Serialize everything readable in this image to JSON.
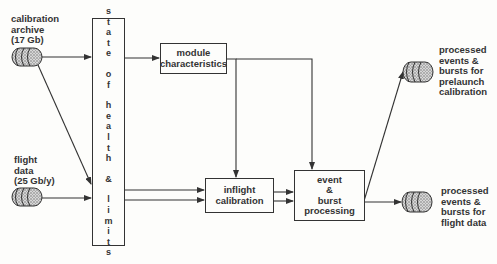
{
  "inputs": [
    {
      "label_lines": [
        "calibration",
        "archive",
        "(17 Gb)"
      ]
    },
    {
      "label_lines": [
        "flight",
        "data",
        "(25 Gb/y)"
      ]
    }
  ],
  "state_of_health": {
    "words": [
      "state",
      "of",
      "health",
      "&",
      "limits"
    ]
  },
  "module_characteristics": {
    "lines": [
      "module",
      "characteristics"
    ]
  },
  "inflight_calibration": {
    "lines": [
      "inflight",
      "calibration"
    ]
  },
  "event_burst": {
    "lines": [
      "event",
      "&",
      "burst",
      "processing"
    ]
  },
  "outputs": [
    {
      "label_lines": [
        "processed",
        "events &",
        "bursts for",
        "prelaunch",
        "calibration"
      ]
    },
    {
      "label_lines": [
        "processed",
        "events &",
        "bursts for",
        "flight data"
      ]
    }
  ],
  "colors": {
    "ink": "#333333",
    "paper": "#fdfdfb"
  }
}
